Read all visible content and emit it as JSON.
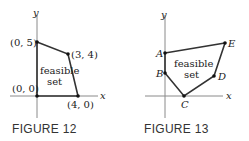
{
  "figures": [
    {
      "caption": "FIGURE 12",
      "axis_x_label": "x",
      "axis_y_label": "y",
      "region_label_line1": "feasible",
      "region_label_line2": "set",
      "vertices": [
        {
          "label": "(0, 0)",
          "x": 0,
          "y": 0
        },
        {
          "label": "(0, 5)",
          "x": 0,
          "y": 5
        },
        {
          "label": "(3, 4)",
          "x": 3,
          "y": 4
        },
        {
          "label": "(4, 0)",
          "x": 4,
          "y": 0
        }
      ]
    },
    {
      "caption": "FIGURE 13",
      "axis_x_label": "x",
      "axis_y_label": "y",
      "region_label_line1": "feasible",
      "region_label_line2": "set",
      "vertices": [
        {
          "label": "A"
        },
        {
          "label": "B"
        },
        {
          "label": "C"
        },
        {
          "label": "D"
        },
        {
          "label": "E"
        }
      ]
    }
  ],
  "colors": {
    "axis": "#8a8a8a",
    "edge": "#333333",
    "point": "#111111",
    "text": "#222222"
  }
}
